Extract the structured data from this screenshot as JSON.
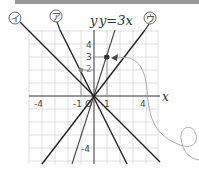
{
  "header_bar": {
    "color": "#9a9a9a"
  },
  "graph": {
    "origin_label": "O",
    "x_axis_label": "x",
    "y_axis_label": "y",
    "x_ticks": [
      "-4",
      "-1",
      "1",
      "4"
    ],
    "y_ticks": [
      "4",
      "3",
      "2",
      "-4"
    ],
    "lines": [
      {
        "id": "i",
        "label": "イ",
        "description": "y = -x"
      },
      {
        "id": "a",
        "label": "ア",
        "description": "y = -2x"
      },
      {
        "id": "y3x",
        "label": "y=3x",
        "description": "y = 3x"
      },
      {
        "id": "u",
        "label": "ウ",
        "description": "y = (4/3)x"
      }
    ],
    "equation_label": "y=3x",
    "points": [
      {
        "x": -1,
        "y": 2,
        "color": "#888888"
      },
      {
        "x": 1,
        "y": 3,
        "color": "#333333"
      }
    ],
    "grid_color": "#d6d6d6",
    "line_color": "#222222",
    "annotation_color": "#999999"
  }
}
